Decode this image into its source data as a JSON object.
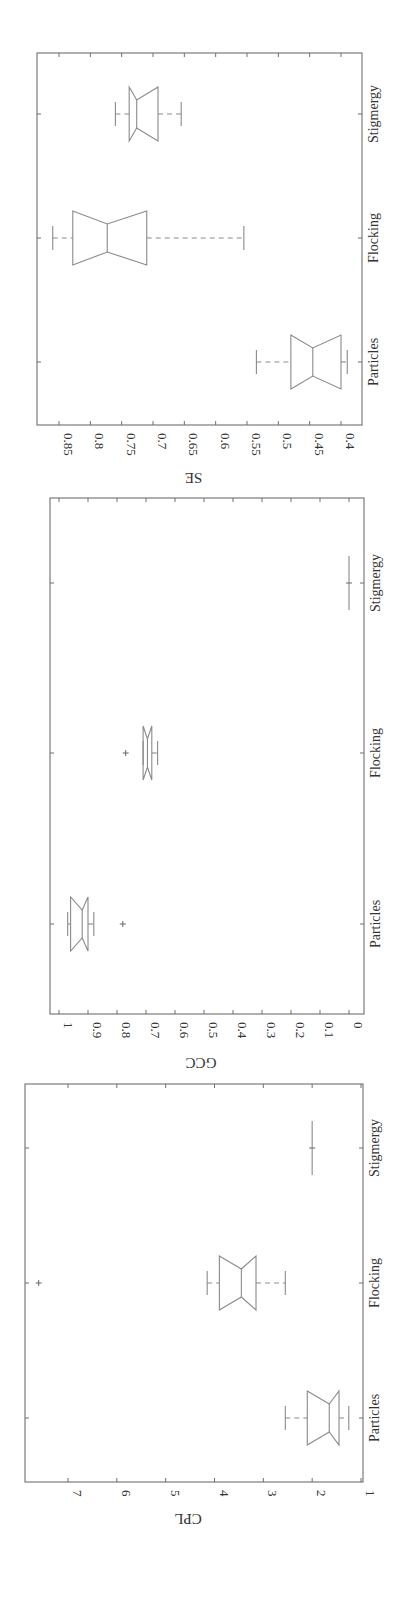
{
  "figure": {
    "orientation": "rotated 90 degrees clockwise",
    "line_color": "#8a8a8a",
    "frame_color": "#6f6f6f"
  },
  "chart_data": [
    {
      "type": "boxplot",
      "title": "",
      "ylabel": "SE",
      "xlabel": "",
      "categories": [
        "Particles",
        "Flocking",
        "Stigmergy"
      ],
      "ylim": [
        0.37,
        0.87
      ],
      "yticks": [
        "0.85",
        "0.8",
        "0.75",
        "0.7",
        "0.65",
        "0.6",
        "0.55",
        "0.5",
        "0.45",
        "0.4"
      ],
      "notched": true,
      "series": [
        {
          "name": "Particles",
          "whisker_low": 0.39,
          "q1": 0.4,
          "median": 0.445,
          "q3": 0.48,
          "whisker_high": 0.535,
          "outliers": []
        },
        {
          "name": "Flocking",
          "whisker_low": 0.555,
          "q1": 0.71,
          "median": 0.773,
          "q3": 0.828,
          "whisker_high": 0.86,
          "outliers": []
        },
        {
          "name": "Stigmergy",
          "whisker_low": 0.655,
          "q1": 0.692,
          "median": 0.726,
          "q3": 0.738,
          "whisker_high": 0.76,
          "outliers": []
        }
      ],
      "frame": {
        "x": 37,
        "y": 53,
        "w": 325,
        "h": 372
      },
      "axis_px": {
        "vmax": 0.85,
        "xmax": 59,
        "vmin": 0.4,
        "xmin": 341
      },
      "cat_y": [
        362,
        238,
        114
      ]
    },
    {
      "type": "boxplot",
      "title": "",
      "ylabel": "GCC",
      "xlabel": "",
      "categories": [
        "Particles",
        "Flocking",
        "Stigmergy"
      ],
      "ylim": [
        -0.03,
        1.03
      ],
      "yticks": [
        "1",
        "0.9",
        "0.8",
        "0.7",
        "0.6",
        "0.5",
        "0.4",
        "0.3",
        "0.2",
        "0.1",
        "0"
      ],
      "notched": true,
      "series": [
        {
          "name": "Particles",
          "whisker_low": 0.88,
          "q1": 0.9,
          "median": 0.92,
          "q3": 0.96,
          "whisker_high": 0.97,
          "outliers": [
            0.78
          ]
        },
        {
          "name": "Flocking",
          "whisker_low": 0.66,
          "q1": 0.68,
          "median": 0.695,
          "q3": 0.71,
          "whisker_high": 0.71,
          "outliers": [
            0.77
          ]
        },
        {
          "name": "Stigmergy",
          "whisker_low": 0.0,
          "q1": 0.0,
          "median": 0.0,
          "q3": 0.0,
          "whisker_high": 0.0,
          "outliers": []
        }
      ],
      "frame": {
        "x": 50,
        "y": 498,
        "w": 314,
        "h": 516
      },
      "axis_px": {
        "vmax": 1.0,
        "xmax": 59,
        "vmin": 0.0,
        "xmax_dummy": 0,
        "xmin": 349
      },
      "cat_y": [
        924,
        753,
        583
      ]
    },
    {
      "type": "boxplot",
      "title": "",
      "ylabel": "CPL",
      "xlabel": "",
      "categories": [
        "Particles",
        "Flocking",
        "Stigmergy"
      ],
      "ylim": [
        0.95,
        7.9
      ],
      "yticks": [
        "7",
        "6",
        "5",
        "4",
        "3",
        "2",
        "1"
      ],
      "notched": true,
      "series": [
        {
          "name": "Particles",
          "whisker_low": 1.25,
          "q1": 1.45,
          "median": 1.65,
          "q3": 2.1,
          "whisker_high": 2.55,
          "outliers": []
        },
        {
          "name": "Flocking",
          "whisker_low": 2.55,
          "q1": 3.15,
          "median": 3.45,
          "q3": 3.9,
          "whisker_high": 4.15,
          "outliers": [
            7.6
          ]
        },
        {
          "name": "Stigmergy",
          "whisker_low": 2.0,
          "q1": 2.0,
          "median": 2.0,
          "q3": 2.0,
          "whisker_high": 2.0,
          "outliers": []
        }
      ],
      "frame": {
        "x": 25,
        "y": 1084,
        "w": 338,
        "h": 398
      },
      "axis_px": {
        "vmax": 7,
        "xmax": 68,
        "vmin": 1,
        "xmin": 361
      },
      "cat_y": [
        1418,
        1283,
        1148
      ]
    }
  ]
}
